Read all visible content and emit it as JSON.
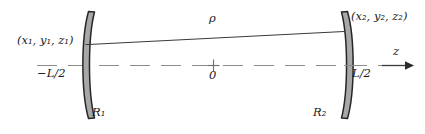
{
  "figure": {
    "background_color": "#ffffff",
    "width": 425,
    "height": 134
  },
  "colors": {
    "mirror_fill": "#a8a8a8",
    "mirror_stroke": "#262626",
    "axis_line": "#8c8c8c",
    "ray_line": "#3a3a3a",
    "text": "#1a1a1a"
  },
  "labels": {
    "point1": "(x₁, y₁, z₁)",
    "point2": "(x₂, y₂, z₂)",
    "rho": "ρ",
    "z_axis": "z",
    "left_position": "−L/2",
    "right_position": "L/2",
    "origin": "0",
    "mirror1": "R₁",
    "mirror2": "R₂"
  },
  "elements": {
    "mirror1_name": "left-concave-mirror",
    "mirror2_name": "right-concave-mirror",
    "ray_name": "rho-separation-line",
    "axis_name": "dashed-optical-axis",
    "origin_marker": "+"
  }
}
